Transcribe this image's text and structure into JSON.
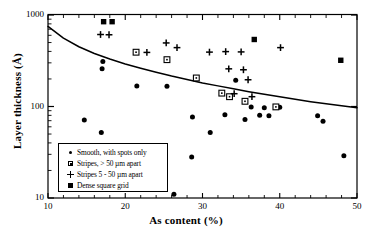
{
  "chart_data": {
    "type": "scatter",
    "title": "",
    "xlabel": "As content (%)",
    "ylabel": "Layer thickness (Å)",
    "xscale": "linear",
    "yscale": "log",
    "xlim": [
      10,
      50
    ],
    "ylim": [
      10,
      1000
    ],
    "xticks": [
      10,
      20,
      30,
      40,
      50
    ],
    "xticklabels": [
      "10",
      "20",
      "30",
      "40",
      "50"
    ],
    "yticks": [
      10,
      100,
      1000
    ],
    "yticklabels": [
      "10",
      "100",
      "1000"
    ],
    "grid": false,
    "legend_position": "lower left",
    "series": [
      {
        "name": "Smooth, with spots only",
        "marker": "filled-circle",
        "color": "#000000",
        "points": [
          [
            14.7,
            71
          ],
          [
            16.9,
            52
          ],
          [
            17.1,
            310
          ],
          [
            17.0,
            258
          ],
          [
            21.5,
            167
          ],
          [
            25.4,
            166
          ],
          [
            26.3,
            11
          ],
          [
            28.6,
            28
          ],
          [
            28.7,
            77
          ],
          [
            31.0,
            52
          ],
          [
            32.9,
            81
          ],
          [
            34.3,
            193
          ],
          [
            35.5,
            72
          ],
          [
            36.3,
            99
          ],
          [
            37.4,
            80
          ],
          [
            38.0,
            97
          ],
          [
            38.6,
            79
          ],
          [
            39.5,
            98
          ],
          [
            40.0,
            98
          ],
          [
            44.9,
            79
          ],
          [
            45.6,
            69
          ],
          [
            48.3,
            29
          ]
        ]
      },
      {
        "name": "Stripes, > 50 µm apart",
        "marker": "open-square",
        "color": "#000000",
        "points": [
          [
            21.4,
            392
          ],
          [
            25.4,
            325
          ],
          [
            29.2,
            205
          ],
          [
            32.5,
            140
          ],
          [
            33.5,
            128
          ],
          [
            35.5,
            114
          ],
          [
            39.5,
            99
          ]
        ]
      },
      {
        "name": "Stripes 5 - 50 µm apart",
        "marker": "plus",
        "color": "#000000",
        "points": [
          [
            16.8,
            612
          ],
          [
            17.9,
            608
          ],
          [
            22.8,
            390
          ],
          [
            25.3,
            495
          ],
          [
            26.7,
            440
          ],
          [
            30.9,
            393
          ],
          [
            33.0,
            398
          ],
          [
            33.4,
            258
          ],
          [
            34.1,
            138
          ],
          [
            35.0,
            395
          ],
          [
            35.3,
            252
          ],
          [
            35.9,
            196
          ],
          [
            36.4,
            128
          ],
          [
            40.1,
            440
          ]
        ]
      },
      {
        "name": "Dense square grid",
        "marker": "filled-square",
        "color": "#000000",
        "points": [
          [
            17.2,
            845
          ],
          [
            18.3,
            845
          ],
          [
            36.7,
            540
          ],
          [
            47.9,
            320
          ]
        ]
      }
    ],
    "trend_curve": {
      "description": "decreasing critical-thickness curve",
      "points": [
        [
          10.0,
          750
        ],
        [
          12.0,
          560
        ],
        [
          14.0,
          450
        ],
        [
          16.0,
          380
        ],
        [
          18.0,
          330
        ],
        [
          20.0,
          292
        ],
        [
          22.0,
          262
        ],
        [
          24.0,
          237
        ],
        [
          26.0,
          215
        ],
        [
          28.0,
          197
        ],
        [
          30.0,
          181
        ],
        [
          32.0,
          168
        ],
        [
          34.0,
          156
        ],
        [
          36.0,
          145
        ],
        [
          38.0,
          136
        ],
        [
          40.0,
          128
        ],
        [
          42.0,
          120
        ],
        [
          44.0,
          113
        ],
        [
          46.0,
          107
        ],
        [
          48.0,
          102
        ],
        [
          50.0,
          97
        ]
      ]
    }
  },
  "legend": {
    "items": [
      {
        "marker": "filled-circle",
        "label": "Smooth, with spots only"
      },
      {
        "marker": "open-square",
        "label": "Stripes, > 50 µm apart"
      },
      {
        "marker": "plus",
        "label": "Stripes 5 - 50 µm apart"
      },
      {
        "marker": "filled-square",
        "label": "Dense square grid"
      }
    ]
  }
}
